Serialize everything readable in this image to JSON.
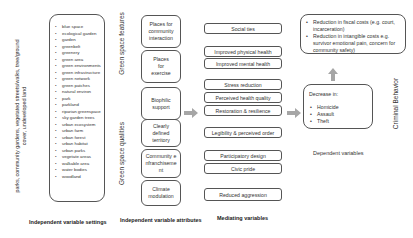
{
  "diagram": {
    "setting_examples": "parks, community gardens, vegetated streets/walks, tree/ground cover, undeveloped land",
    "settings_terms": [
      "blue space",
      "ecological garden",
      "garden",
      "greenbelt",
      "greenery",
      "green area",
      "green environments",
      "green infrastructure",
      "green network",
      "green patches",
      "natural environ",
      "park",
      "parkland",
      "riparian greenspace",
      "sky garden trees",
      "urban ecosystem",
      "urban farm",
      "urban forest",
      "urban habitat",
      "urban parks",
      "vegetate areas",
      "walkable area",
      "water bodies",
      "woodland"
    ],
    "group_labels": {
      "features": "Green space features",
      "qualities": "Green space qualities",
      "criminal": "Criminal Behavior"
    },
    "attributes": [
      "Places for community interaction",
      "Places for exercise",
      "Biophilic support",
      "Clearly defined territory",
      "Community enfranchisement",
      "Climate modulation"
    ],
    "mediators": [
      "Social ties",
      "Improved physical health",
      "Improved mental health",
      "Stress reduction",
      "Perceived health quality",
      "Restoration & resilience",
      "Legibility & perceived order",
      "Participatory design",
      "Civic pride",
      "Reduced aggression"
    ],
    "costs": [
      "Reduction in fiscal costs (e.g. court, incarceration)",
      "Reduction in intangible costs e.g. survivor emotional pain, concern for community safety)"
    ],
    "decrease": {
      "title": "Decrease in:",
      "items": [
        "Homicide",
        "Assault",
        "Theft"
      ]
    },
    "column_labels": {
      "settings": "Independent variable settings",
      "attributes": "Independent variable attributes",
      "mediating": "Mediating variables",
      "dependent": "Dependent variables"
    },
    "colors": {
      "arrow": "#a6a6a6",
      "border": "#555555"
    }
  }
}
